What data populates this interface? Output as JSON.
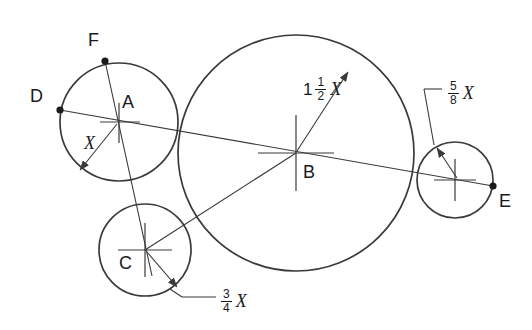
{
  "drawing": {
    "title": "Tangent circles geometric construction",
    "background_color": "#ffffff",
    "line_color": "#3a3a3a",
    "text_color": "#1a1a1a"
  },
  "point_labels": {
    "A": "A",
    "B": "B",
    "C": "C",
    "D": "D",
    "E": "E",
    "F": "F"
  },
  "dimensions": {
    "base": {
      "text": "X",
      "whole": "",
      "numerator": "",
      "denominator": "",
      "variable": "X"
    },
    "circle_b": {
      "whole": "1",
      "numerator": "1",
      "denominator": "2",
      "variable": "X"
    },
    "circle_c": {
      "whole": "",
      "numerator": "3",
      "denominator": "4",
      "variable": "X"
    },
    "circle_e": {
      "whole": "",
      "numerator": "5",
      "denominator": "8",
      "variable": "X"
    }
  },
  "geometry": {
    "circles": [
      {
        "name": "circle-a",
        "cx": 119,
        "cy": 122,
        "r": 59,
        "label": "A",
        "radius_dim": "X"
      },
      {
        "name": "circle-b",
        "cx": 296,
        "cy": 153,
        "r": 118,
        "label": "B",
        "radius_dim": "1 1/2 X"
      },
      {
        "name": "circle-c",
        "cx": 145,
        "cy": 250,
        "r": 46,
        "label": "C",
        "radius_dim": "3/4 X"
      },
      {
        "name": "circle-e",
        "cx": 455,
        "cy": 180,
        "r": 38,
        "label": "E",
        "radius_dim": "5/8 X"
      }
    ],
    "points": [
      {
        "name": "point-d",
        "x": 60,
        "y": 110,
        "label": "D"
      },
      {
        "name": "point-f",
        "x": 105,
        "y": 61,
        "label": "F"
      },
      {
        "name": "point-e",
        "x": 493,
        "y": 186,
        "label": "E"
      }
    ]
  }
}
